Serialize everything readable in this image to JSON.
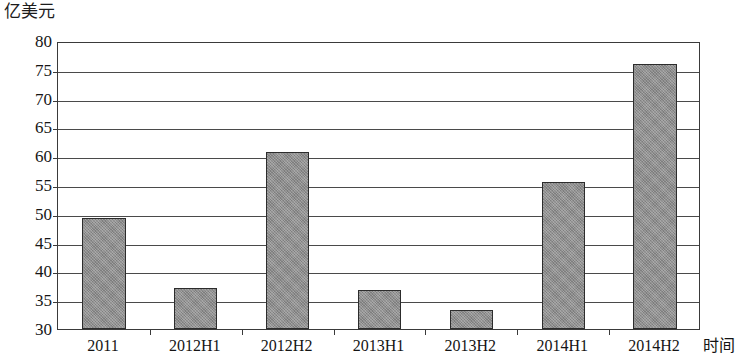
{
  "chart_data": {
    "type": "bar",
    "title": "",
    "subtitle": "",
    "xlabel": "时间",
    "ylabel": "亿美元",
    "categories": [
      "2011",
      "2012H1",
      "2012H2",
      "2013H1",
      "2013H2",
      "2014H1",
      "2014H2"
    ],
    "values": [
      49.3,
      37.2,
      60.8,
      36.8,
      33.3,
      55.6,
      76.0
    ],
    "series": [
      {
        "name": "",
        "values": [
          49.3,
          37.2,
          60.8,
          36.8,
          33.3,
          55.6,
          76.0
        ]
      }
    ],
    "ylim": [
      30,
      80
    ],
    "ytick_values": [
      80,
      75,
      70,
      65,
      60,
      55,
      50,
      45,
      40,
      35,
      30
    ],
    "ytick_labels": [
      "80",
      "75",
      "70",
      "65",
      "60",
      "55",
      "50",
      "45",
      "40",
      "35",
      "30"
    ],
    "grid": "horizontal",
    "legend": "none",
    "bar_color": "#8a8a8a",
    "bar_border_color": "#2c2c2c",
    "axis_color": "#3a3a3a",
    "background_color": "#ffffff"
  }
}
